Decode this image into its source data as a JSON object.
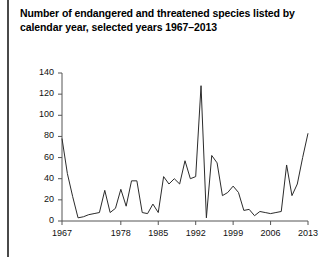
{
  "figure": {
    "title_line1": "Number of endangered and threatened species listed by",
    "title_line2": "calendar year, selected years 1967–2013",
    "left_rule": "left-rule",
    "line_color": "#2b2b2b",
    "axis_color": "#555555",
    "background": "#ffffff"
  },
  "chart_data": {
    "type": "line",
    "title": "Number of endangered and threatened species listed by calendar year, selected years 1967–2013",
    "xlabel": "",
    "ylabel": "",
    "xlim": [
      1967,
      2013
    ],
    "ylim": [
      0,
      140
    ],
    "ytick_values": [
      0,
      20,
      40,
      60,
      80,
      100,
      120,
      140
    ],
    "ytick_labels": [
      "0",
      "20",
      "40",
      "60",
      "80",
      "100",
      "120",
      "140"
    ],
    "xtick_values": [
      1967,
      1978,
      1985,
      1992,
      1999,
      2006,
      2013
    ],
    "xtick_labels": [
      "1967",
      "1978",
      "1985",
      "1992",
      "1999",
      "2006",
      "2013"
    ],
    "grid": false,
    "legend": false,
    "x": [
      1967,
      1968,
      1969,
      1970,
      1971,
      1972,
      1973,
      1974,
      1975,
      1976,
      1977,
      1978,
      1979,
      1980,
      1981,
      1982,
      1983,
      1984,
      1985,
      1986,
      1987,
      1988,
      1989,
      1990,
      1991,
      1992,
      1993,
      1994,
      1995,
      1996,
      1997,
      1998,
      1999,
      2000,
      2001,
      2002,
      2003,
      2004,
      2005,
      2006,
      2007,
      2008,
      2009,
      2010,
      2011,
      2012,
      2013
    ],
    "values": [
      78,
      45,
      23,
      3,
      4,
      6,
      7,
      8,
      29,
      8,
      12,
      30,
      14,
      38,
      38,
      8,
      7,
      16,
      8,
      42,
      35,
      40,
      35,
      57,
      40,
      42,
      128,
      3,
      62,
      55,
      24,
      27,
      33,
      27,
      10,
      11,
      5,
      9,
      8,
      7,
      8,
      9,
      53,
      24,
      35,
      60,
      83
    ],
    "series": [
      {
        "name": "Species listed",
        "values": [
          78,
          45,
          23,
          3,
          4,
          6,
          7,
          8,
          29,
          8,
          12,
          30,
          14,
          38,
          38,
          8,
          7,
          16,
          8,
          42,
          35,
          40,
          35,
          57,
          40,
          42,
          128,
          3,
          62,
          55,
          24,
          27,
          33,
          27,
          10,
          11,
          5,
          9,
          8,
          7,
          8,
          9,
          53,
          24,
          35,
          60,
          83
        ],
        "color": "#2b2b2b"
      }
    ]
  }
}
